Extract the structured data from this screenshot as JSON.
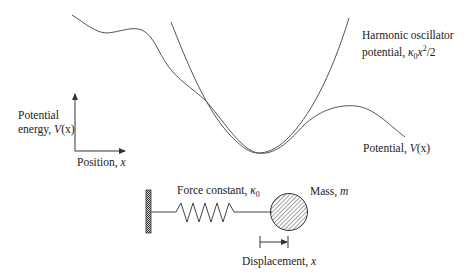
{
  "diagram": {
    "labels": {
      "harmonic_line1": "Harmonic oscillator",
      "harmonic_line2_prefix": "potential, ",
      "harmonic_kappa": "κ",
      "harmonic_kappa_sub": "0",
      "harmonic_x": "x",
      "harmonic_sup": "2",
      "harmonic_suffix": "/2",
      "y_axis_line1": "Potential",
      "y_axis_line2_prefix": "energy, ",
      "y_axis_V": "V",
      "y_axis_paren": "(x)",
      "x_axis_prefix": "Position, ",
      "x_axis_var": "x",
      "potential_prefix": "Potential, ",
      "potential_V": "V",
      "potential_paren": "(x)",
      "force_prefix": "Force constant, ",
      "force_kappa": "κ",
      "force_sub": "0",
      "mass_prefix": "Mass, ",
      "mass_var": "m",
      "displacement_prefix": "Displacement, ",
      "displacement_var": "x"
    },
    "elements": {
      "potential_curve": "V(x) anharmonic potential",
      "harmonic_curve": "parabola κ0 x²/2",
      "wall": "fixed hatched wall",
      "spring": "zigzag spring",
      "mass": "hatched sphere",
      "displacement_arrow": "arrow to the right"
    },
    "colors": {
      "line": "#555555",
      "text": "#222222"
    }
  }
}
